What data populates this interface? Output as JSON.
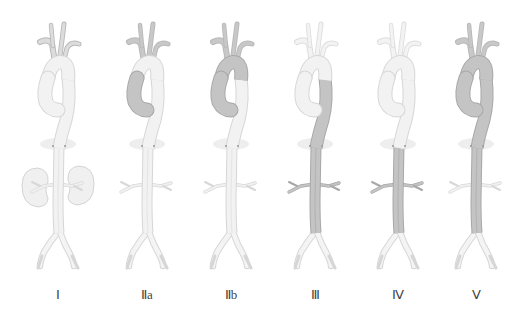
{
  "figure": {
    "colors": {
      "normal_fill": "#f2f2f2",
      "normal_stroke": "#d6d6d6",
      "dissected_fill": "#c4c4c4",
      "dissected_stroke": "#a8a8a8",
      "branch_fill": "#dcdcdc",
      "kidney_fill": "#f0f0f0",
      "label_color": "#444444"
    },
    "types": [
      {
        "label": "Ⅰ",
        "center_x": 58,
        "dissected": {
          "ascending": false,
          "arch": false,
          "descending": false,
          "abdominal": false
        },
        "branches_dark": false,
        "kidneys": true,
        "light_branches": false
      },
      {
        "label": "Ⅱa",
        "center_x": 147,
        "dissected": {
          "ascending": true,
          "arch": false,
          "descending": false,
          "abdominal": false
        },
        "branches_dark": true,
        "kidneys": false,
        "light_branches": false
      },
      {
        "label": "Ⅱb",
        "center_x": 231,
        "dissected": {
          "ascending": true,
          "arch": true,
          "descending": false,
          "abdominal": false
        },
        "branches_dark": true,
        "kidneys": false,
        "light_branches": false
      },
      {
        "label": "Ⅲ",
        "center_x": 315,
        "dissected": {
          "ascending": false,
          "arch": false,
          "descending": true,
          "abdominal": true
        },
        "branches_dark": false,
        "kidneys": false,
        "light_branches": true
      },
      {
        "label": "Ⅳ",
        "center_x": 398,
        "dissected": {
          "ascending": false,
          "arch": false,
          "descending": false,
          "abdominal": true
        },
        "branches_dark": false,
        "kidneys": false,
        "light_branches": true
      },
      {
        "label": "Ⅴ",
        "center_x": 476,
        "dissected": {
          "ascending": true,
          "arch": true,
          "descending": true,
          "abdominal": true
        },
        "branches_dark": true,
        "kidneys": false,
        "light_branches": false
      }
    ]
  }
}
